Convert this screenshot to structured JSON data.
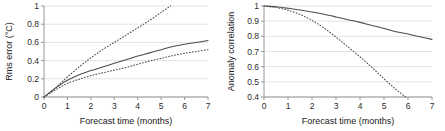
{
  "figure": {
    "background": "#ffffff",
    "panel_count": 2,
    "line_color": "#4d4d4d",
    "grid_color": "#d9d9d9",
    "axis_color": "#8c8c8c"
  },
  "chart_data": [
    {
      "type": "line",
      "panel": "left",
      "title": "",
      "xlabel": "Forecast time (months)",
      "ylabel": "Rms error (°C)",
      "xlim": [
        0,
        7
      ],
      "ylim": [
        0,
        1
      ],
      "xticks": [
        0,
        1,
        2,
        3,
        4,
        5,
        6,
        7
      ],
      "xticklabels": [
        "0",
        "1",
        "2",
        "3",
        "4",
        "5",
        "6",
        "7"
      ],
      "yticks": [
        0,
        0.2,
        0.4,
        0.6,
        0.8,
        1
      ],
      "yticklabels": [
        "0",
        "0.2",
        "0.4",
        "0.6",
        "0.8",
        "1"
      ],
      "grid": true,
      "legend": "none",
      "series": [
        {
          "name": "persistence",
          "style": "dotted",
          "x": [
            0,
            0.25,
            0.5,
            0.75,
            1,
            1.5,
            2,
            2.5,
            3,
            3.5,
            4,
            4.5,
            5,
            5.4
          ],
          "values": [
            0,
            0.05,
            0.1,
            0.16,
            0.22,
            0.33,
            0.43,
            0.52,
            0.6,
            0.68,
            0.76,
            0.84,
            0.93,
            1.0
          ]
        },
        {
          "name": "model-forecast",
          "style": "solid",
          "x": [
            0,
            0.25,
            0.5,
            0.75,
            1,
            1.5,
            2,
            2.5,
            3,
            3.5,
            4,
            4.5,
            5,
            5.5,
            6,
            6.5,
            7
          ],
          "values": [
            0,
            0.05,
            0.1,
            0.145,
            0.185,
            0.245,
            0.29,
            0.33,
            0.37,
            0.41,
            0.45,
            0.485,
            0.52,
            0.555,
            0.58,
            0.6,
            0.62
          ]
        },
        {
          "name": "lower-bound",
          "style": "dotted",
          "x": [
            0,
            0.25,
            0.5,
            0.75,
            1,
            1.5,
            2,
            2.5,
            3,
            3.5,
            4,
            4.5,
            5,
            5.5,
            6,
            6.5,
            7
          ],
          "values": [
            0,
            0.04,
            0.08,
            0.115,
            0.15,
            0.195,
            0.235,
            0.265,
            0.295,
            0.325,
            0.36,
            0.395,
            0.425,
            0.455,
            0.48,
            0.5,
            0.52
          ]
        }
      ]
    },
    {
      "type": "line",
      "panel": "right",
      "title": "",
      "xlabel": "Forecast time (months)",
      "ylabel": "Anomaly correlation",
      "xlim": [
        0,
        7
      ],
      "ylim": [
        0.4,
        1
      ],
      "xticks": [
        0,
        1,
        2,
        3,
        4,
        5,
        6,
        7
      ],
      "xticklabels": [
        "0",
        "1",
        "2",
        "3",
        "4",
        "5",
        "6",
        "7"
      ],
      "yticks": [
        0.4,
        0.5,
        0.6,
        0.7,
        0.8,
        0.9,
        1
      ],
      "yticklabels": [
        "0.4",
        "0.5",
        "0.6",
        "0.7",
        "0.8",
        "0.9",
        "1"
      ],
      "grid": true,
      "legend": "none",
      "series": [
        {
          "name": "model-forecast",
          "style": "solid",
          "x": [
            0,
            0.5,
            1,
            1.5,
            2,
            2.5,
            3,
            3.5,
            4,
            4.5,
            5,
            5.5,
            6,
            6.5,
            7
          ],
          "values": [
            1.0,
            0.995,
            0.985,
            0.973,
            0.96,
            0.945,
            0.928,
            0.91,
            0.892,
            0.872,
            0.852,
            0.83,
            0.815,
            0.797,
            0.78
          ]
        },
        {
          "name": "persistence",
          "style": "dotted",
          "x": [
            0,
            0.25,
            0.5,
            0.75,
            1,
            1.5,
            2,
            2.5,
            3,
            3.5,
            4,
            4.5,
            5,
            5.5,
            5.9
          ],
          "values": [
            1.0,
            0.995,
            0.99,
            0.982,
            0.972,
            0.945,
            0.905,
            0.855,
            0.795,
            0.73,
            0.665,
            0.595,
            0.52,
            0.45,
            0.4
          ]
        }
      ]
    }
  ]
}
